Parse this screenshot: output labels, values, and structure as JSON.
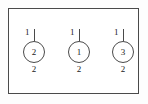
{
  "diagram": {
    "frame": {
      "border_color": "#4a4a4a",
      "background_color": "#ffffff"
    },
    "nodes": [
      {
        "id": "node-1",
        "top_label": "1",
        "center_label": "2",
        "bottom_label": "2",
        "left": 17
      },
      {
        "id": "node-2",
        "top_label": "1",
        "center_label": "1",
        "bottom_label": "2",
        "left": 62
      },
      {
        "id": "node-3",
        "top_label": "1",
        "center_label": "3",
        "bottom_label": "2",
        "left": 106
      }
    ]
  }
}
